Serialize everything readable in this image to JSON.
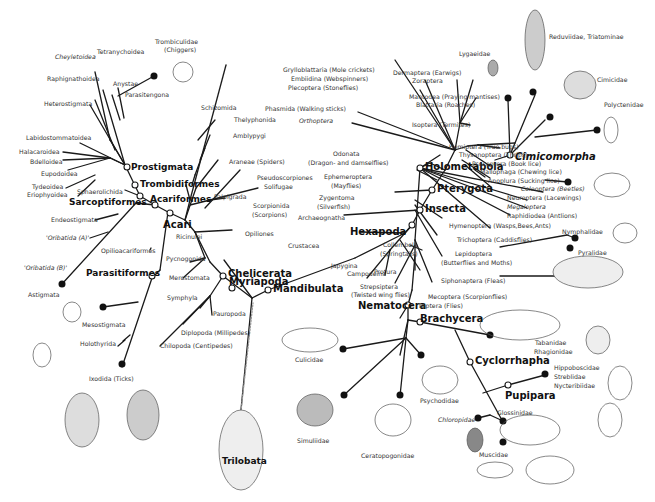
{
  "diagram": {
    "type": "phylogenetic-tree",
    "root": "Trilobata",
    "clades": {
      "mandibulata": "Mandibulata",
      "chelicerata": "Chelicerata",
      "myriapoda": "Myriapoda",
      "hexapoda": "Hexapoda",
      "insecta": "Insecta",
      "pterygota": "Pterygota",
      "holometabola": "Holometabola",
      "cimicomorpha": "Cimicomorpha",
      "nematocera": "Nematocera",
      "brachycera": "Brachycera",
      "cyclorrhapha": "Cyclorrhapha",
      "pupipara": "Pupipara",
      "acari": "Acari",
      "acariformes": "Acariformes",
      "trombidiformes": "Trombidiformes",
      "prostigmata": "Prostigmata",
      "sarcoptiformes": "Sarcoptiformes",
      "parasitiformes": "Parasitiformes",
      "trilobata": "Trilobata"
    },
    "labels": {
      "trombiculidae": "Trombiculidae",
      "chiggers": "(Chiggers)",
      "tetranychoidea": "Tetranychoidea",
      "cheyletoidea": "Cheyletoidea",
      "raphignathoidea": "Raphignathoidea",
      "anystae": "Anystae",
      "parasitengona": "Parasitengona",
      "heterostigmata": "Heterostigmata",
      "labidostommatoidea": "Labidostommatoidea",
      "halacaroidea": "Halacaroidea",
      "bdelloidea": "Bdelloidea",
      "eupodoidea": "Eupodoidea",
      "tydeoidea": "Tydeoidea",
      "eriophyoidea": "Eriophyoidea",
      "sphaerolichida": "Sphaerolichida",
      "endeostigmata": "Endeostigmata",
      "oribatida_a": "'Oribatida (A)'",
      "oribatida_b": "'Oribatida (B)'",
      "opilioacariformes": "Opilioacariformes",
      "astigmata": "Astigmata",
      "mesostigmata": "Mesostigmata",
      "holothyrida": "Holothyrida",
      "ixodida": "Ixodida (Ticks)",
      "schizomida": "Schizomida",
      "thelyphonida": "Thelyphonida",
      "amblypygi": "Amblypygi",
      "araneae": "Araneae (Spiders)",
      "palpigrada": "Palpigrada",
      "pseudoscorpiones": "Pseudoscorpiones",
      "solifugae": "Solifugae",
      "scorpionida": "Scorpionida",
      "scorpions": "(Scorpions)",
      "opiliones": "Opiliones",
      "ricinulei": "Ricinulei",
      "pycnogonida": "Pycnogonida",
      "merostomata": "Merostomata",
      "symphyla": "Symphyla",
      "pauropoda": "Pauropoda",
      "diplopoda": "Diplopoda (Millipedes)",
      "chilopoda": "Chilopoda (Centipedes)",
      "crustacea": "Crustacea",
      "grylloblattaria": "Grylloblattaria (Mole crickets)",
      "embiidina": "Embiidina (Webspinners)",
      "plecoptera": "Plecoptera (Stoneflies)",
      "phasmida": "Phasmida (Walking sticks)",
      "orthoptera": "Orthoptera",
      "dermaptera": "Dermaptera (Earwigs)",
      "zoraptera": "Zoraptera",
      "mantodea": "Mantodea (Praying mantises)",
      "blattaria": "Blattaria (Roaches)",
      "isoptera": "Isoptera (Termites)",
      "odonata": "Odonata",
      "odonata_common": "(Dragon- and damselflies)",
      "ephemeroptera": "Ephemeroptera",
      "mayflies": "(Mayflies)",
      "zygentoma": "Zygentoma",
      "silverfish": "(Silverfish)",
      "archaeognatha": "Archaeognatha",
      "collembola": "Collembola",
      "springtails": "(Springtails)",
      "japygina": "Japygina",
      "campodeina": "Campodeina",
      "protura": "Protura",
      "hemiptera": "Hemiptera (True bugs)",
      "thysanoptera": "Thysanoptera (Thrips)",
      "psocoptera": "Psocoptera (Book lice)",
      "mallophaga": "Mallophaga (Chewing lice)",
      "anoplura": "Anoplura (Sucking lice)",
      "coleoptera": "Coleoptera (Beetles)",
      "neuroptera": "Neuroptera (Lacewings)",
      "megaloptera": "Megaloptera",
      "raphidiodea": "Raphidiodea (Antlions)",
      "hymenoptera": "Hymenoptera (Wasps,Bees,Ants)",
      "trichoptera": "Trichoptera (Caddisflies)",
      "lepidoptera": "Lepidoptera",
      "lepidoptera_common": "(Butterflies and Moths)",
      "siphonaptera": "Siphonaptera (Fleas)",
      "strepsiptera": "Strepsiptera",
      "strepsiptera_common": "(Twisted wing flies)",
      "mecoptera": "Mecoptera (Scorpionflies)",
      "diptera": "Diptera (Flies)",
      "lygaeidae": "Lygaeidae",
      "reduviidae": "Reduviidae, Triatominae",
      "cimicidae": "Cimicidae",
      "polyctenidae": "Polyctenidae",
      "nymphalidae": "Nymphalidae",
      "pyralidae": "Pyralidae",
      "tabanidae": "Tabanidae",
      "rhagionidae": "Rhagionidae",
      "hippoboscidae": "Hippoboscidae",
      "streblidae": "Streblidae",
      "nycteribiidae": "Nycteribiidae",
      "culicidae": "Culicidae",
      "psychodidae": "Psychodidae",
      "chloropidae": "Chloropidae",
      "glossinidae": "Glossinidae",
      "muscidae": "Muscidae",
      "simuliidae": "Simuliidae",
      "ceratopogonidae": "Ceratopogonidae"
    },
    "colors": {
      "line": "#1a1a1a",
      "text": "#333333",
      "background": "#ffffff",
      "node_fill": "#ffffff",
      "terminal_dot": "#111111"
    }
  }
}
